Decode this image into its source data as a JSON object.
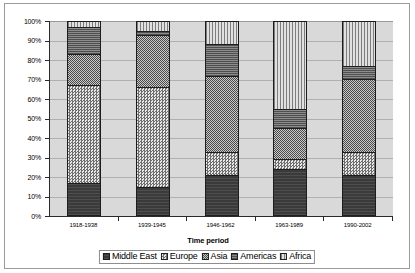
{
  "chart_data": {
    "type": "bar",
    "subtype": "stacked-100-percent",
    "title": "",
    "xlabel": "Time period",
    "ylabel": "",
    "ylim": [
      0,
      100
    ],
    "ytick_labels": [
      "0%",
      "10%",
      "20%",
      "30%",
      "40%",
      "50%",
      "60%",
      "70%",
      "80%",
      "90%",
      "100%"
    ],
    "ytick_values": [
      0,
      10,
      20,
      30,
      40,
      50,
      60,
      70,
      80,
      90,
      100
    ],
    "grid": true,
    "legend_position": "bottom",
    "categories": [
      "1918-1938",
      "1939-1945",
      "1946-1962",
      "1963-1989",
      "1990-2002"
    ],
    "series": [
      {
        "name": "Middle East",
        "pattern": "solid-dark",
        "values": [
          17,
          15,
          21,
          24,
          21
        ]
      },
      {
        "name": "Europe",
        "pattern": "checker-light",
        "values": [
          50,
          51,
          12,
          5,
          12
        ]
      },
      {
        "name": "Asia",
        "pattern": "checker-dense",
        "values": [
          16,
          27,
          39,
          16,
          37
        ]
      },
      {
        "name": "Americas",
        "pattern": "horizontal-lines",
        "values": [
          14,
          2,
          16,
          10,
          7
        ]
      },
      {
        "name": "Africa",
        "pattern": "vertical-lines",
        "values": [
          3,
          5,
          12,
          45,
          23
        ]
      }
    ]
  },
  "legend": {
    "items": [
      {
        "label": "Middle East"
      },
      {
        "label": "Europe"
      },
      {
        "label": "Asia"
      },
      {
        "label": "Americas"
      },
      {
        "label": "Africa"
      }
    ]
  },
  "colors": {
    "plot_background": "#d9d9d9",
    "page_background": "#ffffff",
    "gridline": "#b0b0b0",
    "axis": "#2a2a2a",
    "frame": "#9a9a9a"
  }
}
